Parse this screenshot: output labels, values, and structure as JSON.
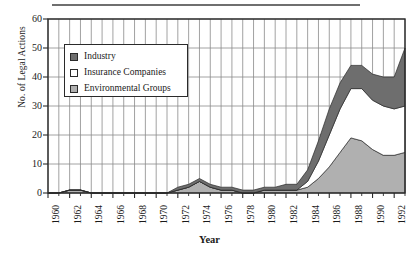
{
  "chart_data": {
    "type": "area",
    "stacked": true,
    "title": "",
    "xlabel": "Year",
    "ylabel": "No. of Legal Actions",
    "xlim": [
      1960,
      1993
    ],
    "ylim": [
      0,
      60
    ],
    "ytick_labels": [
      "0",
      "10",
      "20",
      "30",
      "40",
      "50",
      "60"
    ],
    "ytick_values": [
      0,
      10,
      20,
      30,
      40,
      50,
      60
    ],
    "xtick_labels": [
      "1960",
      "1962",
      "1964",
      "1966",
      "1968",
      "1970",
      "1972",
      "1974",
      "1976",
      "1978",
      "1980",
      "1982",
      "1984",
      "1986",
      "1988",
      "1990",
      "1992"
    ],
    "xtick_values": [
      1960,
      1962,
      1964,
      1966,
      1968,
      1970,
      1972,
      1974,
      1976,
      1978,
      1980,
      1982,
      1984,
      1986,
      1988,
      1990,
      1992
    ],
    "grid": true,
    "grid_axis": "both",
    "legend_position": "upper-left-inside",
    "x": [
      1960,
      1961,
      1962,
      1963,
      1964,
      1965,
      1966,
      1967,
      1968,
      1969,
      1970,
      1971,
      1972,
      1973,
      1974,
      1975,
      1976,
      1977,
      1978,
      1979,
      1980,
      1981,
      1982,
      1983,
      1984,
      1985,
      1986,
      1987,
      1988,
      1989,
      1990,
      1991,
      1992,
      1993
    ],
    "series": [
      {
        "name": "Environmental Groups",
        "color": "#b0b0b0",
        "values": [
          0,
          0,
          1,
          1,
          0,
          0,
          0,
          0,
          0,
          0,
          0,
          0,
          1,
          2,
          4,
          2,
          1,
          1,
          0,
          0,
          1,
          1,
          1,
          1,
          2,
          5,
          9,
          14,
          19,
          18,
          15,
          13,
          13,
          14
        ]
      },
      {
        "name": "Insurance Companies",
        "color": "#ffffff",
        "values": [
          0,
          0,
          0,
          0,
          0,
          0,
          0,
          0,
          0,
          0,
          0,
          0,
          0,
          0,
          0,
          0,
          0,
          0,
          0,
          0,
          0,
          0,
          0,
          0,
          2,
          6,
          11,
          15,
          17,
          18,
          17,
          17,
          16,
          16
        ]
      },
      {
        "name": "Industry",
        "color": "#6e6e6e",
        "values": [
          0,
          0,
          0,
          0,
          0,
          0,
          0,
          0,
          0,
          0,
          0,
          0,
          1,
          1,
          1,
          1,
          1,
          1,
          1,
          1,
          1,
          1,
          2,
          2,
          4,
          7,
          9,
          9,
          8,
          8,
          9,
          10,
          11,
          20
        ]
      }
    ]
  },
  "legend": {
    "items": [
      {
        "label": "Industry",
        "swatch": "#6e6e6e"
      },
      {
        "label": "Insurance Companies",
        "swatch": "#ffffff"
      },
      {
        "label": "Environmental Groups",
        "swatch": "#b0b0b0"
      }
    ]
  },
  "style": {
    "axis_color": "#2a2a2a",
    "grid_color": "#8a8a8a",
    "rule_color": "#6f6f6f"
  }
}
